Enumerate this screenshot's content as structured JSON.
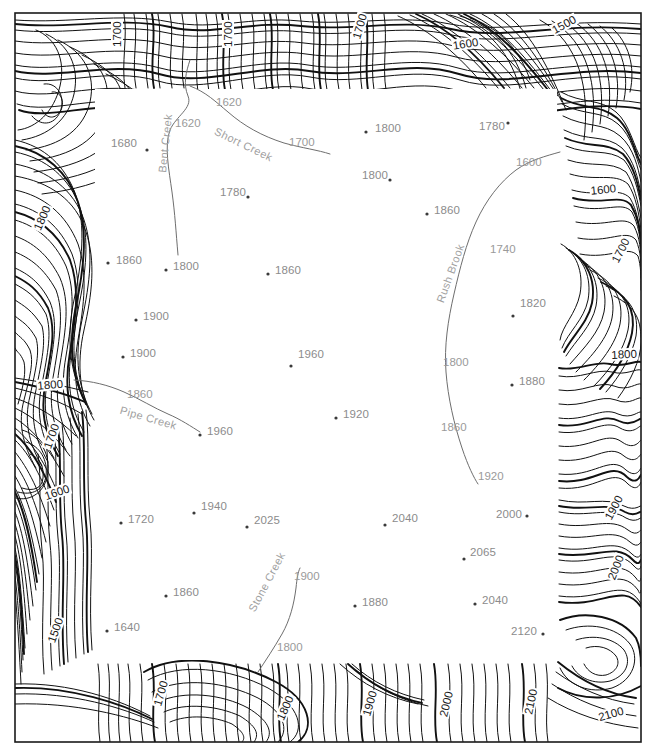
{
  "map": {
    "title": "Topographic Contour Map",
    "frame": {
      "x": 15,
      "y": 13,
      "width": 626,
      "height": 729,
      "border_color": "#1a1a1a"
    },
    "study_area": {
      "x": 95,
      "y": 89,
      "width": 462,
      "height": 571,
      "fill": "#ffffff"
    },
    "colors": {
      "contour_line": "#111111",
      "contour_label": "#1a1a1a",
      "stream_line": "#6e6e6e",
      "stream_label": "#a0a0a0",
      "spot_label": "#8c8c8c",
      "spot_dot": "#3a3a3a",
      "background": "#ffffff"
    },
    "contour_interval": 20,
    "units": "feet"
  },
  "spot_elevations": [
    {
      "label": "1680",
      "x": 111,
      "y": 137,
      "dot_x": 147,
      "dot_y": 150
    },
    {
      "label": "1800",
      "x": 375,
      "y": 122,
      "dot_x": 366,
      "dot_y": 132
    },
    {
      "label": "1780",
      "x": 479,
      "y": 120,
      "dot_x": 508,
      "dot_y": 123
    },
    {
      "label": "1780",
      "x": 220,
      "y": 186,
      "dot_x": 248,
      "dot_y": 197
    },
    {
      "label": "1800",
      "x": 362,
      "y": 169,
      "dot_x": 390,
      "dot_y": 180
    },
    {
      "label": "1860",
      "x": 434,
      "y": 204,
      "dot_x": 427,
      "dot_y": 214
    },
    {
      "label": "1860",
      "x": 116,
      "y": 254,
      "dot_x": 108,
      "dot_y": 263
    },
    {
      "label": "1800",
      "x": 173,
      "y": 260,
      "dot_x": 166,
      "dot_y": 270
    },
    {
      "label": "1860",
      "x": 275,
      "y": 264,
      "dot_x": 268,
      "dot_y": 274
    },
    {
      "label": "1820",
      "x": 520,
      "y": 297,
      "dot_x": 513,
      "dot_y": 316
    },
    {
      "label": "1900",
      "x": 143,
      "y": 310,
      "dot_x": 136,
      "dot_y": 320
    },
    {
      "label": "1900",
      "x": 130,
      "y": 347,
      "dot_x": 123,
      "dot_y": 357
    },
    {
      "label": "1960",
      "x": 298,
      "y": 348,
      "dot_x": 291,
      "dot_y": 366
    },
    {
      "label": "1880",
      "x": 519,
      "y": 375,
      "dot_x": 512,
      "dot_y": 385
    },
    {
      "label": "1920",
      "x": 343,
      "y": 408,
      "dot_x": 336,
      "dot_y": 418
    },
    {
      "label": "1960",
      "x": 207,
      "y": 425,
      "dot_x": 200,
      "dot_y": 435
    },
    {
      "label": "1720",
      "x": 128,
      "y": 513,
      "dot_x": 121,
      "dot_y": 523
    },
    {
      "label": "1940",
      "x": 201,
      "y": 500,
      "dot_x": 194,
      "dot_y": 513
    },
    {
      "label": "2025",
      "x": 254,
      "y": 514,
      "dot_x": 247,
      "dot_y": 527
    },
    {
      "label": "2040",
      "x": 392,
      "y": 512,
      "dot_x": 385,
      "dot_y": 525
    },
    {
      "label": "2000",
      "x": 496,
      "y": 508,
      "dot_x": 527,
      "dot_y": 516
    },
    {
      "label": "2065",
      "x": 470,
      "y": 546,
      "dot_x": 464,
      "dot_y": 559
    },
    {
      "label": "1860",
      "x": 173,
      "y": 586,
      "dot_x": 166,
      "dot_y": 596
    },
    {
      "label": "1880",
      "x": 362,
      "y": 596,
      "dot_x": 355,
      "dot_y": 606
    },
    {
      "label": "2040",
      "x": 482,
      "y": 594,
      "dot_x": 475,
      "dot_y": 604
    },
    {
      "label": "1640",
      "x": 114,
      "y": 621,
      "dot_x": 107,
      "dot_y": 631
    },
    {
      "label": "2120",
      "x": 511,
      "y": 625,
      "dot_x": 543,
      "dot_y": 634
    }
  ],
  "streams": [
    {
      "name": "Bent Creek",
      "label_x": 156,
      "label_y": 172,
      "rotate": -84
    },
    {
      "name": "Short Creek",
      "label_x": 218,
      "label_y": 125,
      "rotate": 26
    },
    {
      "name": "Rush Brook",
      "label_x": 434,
      "label_y": 300,
      "rotate": -70
    },
    {
      "name": "Pipe Creek",
      "label_x": 122,
      "label_y": 404,
      "rotate": 16
    },
    {
      "name": "Stone Creek",
      "label_x": 246,
      "label_y": 608,
      "rotate": -62
    }
  ],
  "stream_elevations": [
    {
      "label": "1620",
      "x": 175,
      "y": 117
    },
    {
      "label": "1620",
      "x": 216,
      "y": 96
    },
    {
      "label": "1700",
      "x": 289,
      "y": 136
    },
    {
      "label": "1600",
      "x": 516,
      "y": 156
    },
    {
      "label": "1740",
      "x": 490,
      "y": 243
    },
    {
      "label": "1800",
      "x": 443,
      "y": 356
    },
    {
      "label": "1860",
      "x": 441,
      "y": 421
    },
    {
      "label": "1920",
      "x": 478,
      "y": 470
    },
    {
      "label": "1860",
      "x": 127,
      "y": 388
    },
    {
      "label": "1900",
      "x": 294,
      "y": 570
    },
    {
      "label": "1800",
      "x": 277,
      "y": 641
    }
  ],
  "contour_labels": [
    {
      "value": "1700",
      "x": 111,
      "y": 48,
      "rotate": -90
    },
    {
      "value": "1700",
      "x": 222,
      "y": 48,
      "rotate": -90
    },
    {
      "value": "1700",
      "x": 350,
      "y": 38,
      "rotate": -74
    },
    {
      "value": "1600",
      "x": 451,
      "y": 40,
      "rotate": -9
    },
    {
      "value": "1500",
      "x": 549,
      "y": 26,
      "rotate": -29
    },
    {
      "value": "1600",
      "x": 589,
      "y": 185,
      "rotate": -6
    },
    {
      "value": "1700",
      "x": 609,
      "y": 260,
      "rotate": -63
    },
    {
      "value": "1800",
      "x": 610,
      "y": 349,
      "rotate": -3
    },
    {
      "value": "1800",
      "x": 31,
      "y": 228,
      "rotate": -66
    },
    {
      "value": "1800",
      "x": 36,
      "y": 380,
      "rotate": -5
    },
    {
      "value": "1700",
      "x": 41,
      "y": 447,
      "rotate": -70
    },
    {
      "value": "1600",
      "x": 42,
      "y": 491,
      "rotate": -19
    },
    {
      "value": "1500",
      "x": 45,
      "y": 641,
      "rotate": -70
    },
    {
      "value": "1900",
      "x": 602,
      "y": 517,
      "rotate": -62
    },
    {
      "value": "2000",
      "x": 605,
      "y": 578,
      "rotate": -68
    },
    {
      "value": "1700",
      "x": 151,
      "y": 705,
      "rotate": -74
    },
    {
      "value": "1800",
      "x": 274,
      "y": 718,
      "rotate": -66
    },
    {
      "value": "1900",
      "x": 360,
      "y": 715,
      "rotate": -74
    },
    {
      "value": "2000",
      "x": 437,
      "y": 716,
      "rotate": -76
    },
    {
      "value": "2100",
      "x": 522,
      "y": 714,
      "rotate": -78
    },
    {
      "value": "2100",
      "x": 596,
      "y": 712,
      "rotate": -16
    }
  ],
  "chart_data": {
    "type": "contour-map",
    "contour_interval": 20,
    "contour_values_shown": [
      1500,
      1600,
      1700,
      1800,
      1900,
      2000,
      2100
    ],
    "elevation_range": [
      1500,
      2120
    ],
    "spot_elevation_values": [
      1680,
      1800,
      1780,
      1780,
      1800,
      1860,
      1860,
      1800,
      1860,
      1820,
      1900,
      1900,
      1960,
      1880,
      1920,
      1960,
      1720,
      1940,
      2025,
      2040,
      2000,
      2065,
      1860,
      1880,
      2040,
      1640,
      2120
    ],
    "stream_names": [
      "Bent Creek",
      "Short Creek",
      "Rush Brook",
      "Pipe Creek",
      "Stone Creek"
    ],
    "stream_elevation_values": [
      1620,
      1620,
      1700,
      1600,
      1740,
      1800,
      1860,
      1920,
      1860,
      1900,
      1800
    ],
    "xlabel": "",
    "ylabel": "",
    "grid": false,
    "legend": "none"
  }
}
